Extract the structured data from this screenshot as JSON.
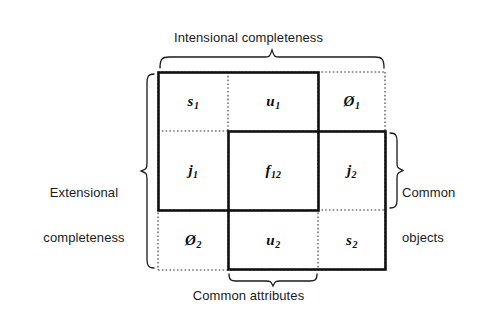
{
  "figure": {
    "type": "venn-grid-diagram",
    "background_color": "#ffffff",
    "line_color": "#111111",
    "labels": {
      "top": "Intensional completeness",
      "left_line1": "Extensional",
      "left_line2": "completeness",
      "right_line1": "Common",
      "right_line2": "objects",
      "bottom": "Common attributes"
    },
    "grid": {
      "columns": 3,
      "rows": 3,
      "cells": [
        {
          "id": "r1c1",
          "base": "s",
          "sub": "1",
          "text": "s1"
        },
        {
          "id": "r1c2",
          "base": "u",
          "sub": "1",
          "text": "u1"
        },
        {
          "id": "r1c3",
          "base": "Ø",
          "sub": "1",
          "text": "Ø1"
        },
        {
          "id": "r2c1",
          "base": "j",
          "sub": "1",
          "text": "j1"
        },
        {
          "id": "r2c2",
          "base": "f",
          "sub": "12",
          "text": "f12"
        },
        {
          "id": "r2c3",
          "base": "j",
          "sub": "2",
          "text": "j2"
        },
        {
          "id": "r3c1",
          "base": "Ø",
          "sub": "2",
          "text": "Ø2"
        },
        {
          "id": "r3c2",
          "base": "u",
          "sub": "2",
          "text": "u2"
        },
        {
          "id": "r3c3",
          "base": "s",
          "sub": "2",
          "text": "s2"
        }
      ]
    },
    "boxes": [
      {
        "name": "set-1-box",
        "style": "solid-thick",
        "covers": [
          "r1c1",
          "r1c2",
          "r2c1",
          "r2c2"
        ]
      },
      {
        "name": "set-2-box",
        "style": "solid-thick",
        "covers": [
          "r2c2",
          "r2c3",
          "r3c2",
          "r3c3"
        ]
      },
      {
        "name": "universe-box",
        "style": "dotted",
        "covers": "all-nine-cells"
      }
    ],
    "braces": [
      {
        "name": "top-brace",
        "orientation": "down",
        "label": "Intensional completeness"
      },
      {
        "name": "left-brace",
        "orientation": "left",
        "label": "Extensional completeness"
      },
      {
        "name": "right-brace",
        "orientation": "right",
        "label": "Common objects"
      },
      {
        "name": "bottom-brace",
        "orientation": "up",
        "label": "Common attributes"
      }
    ]
  }
}
